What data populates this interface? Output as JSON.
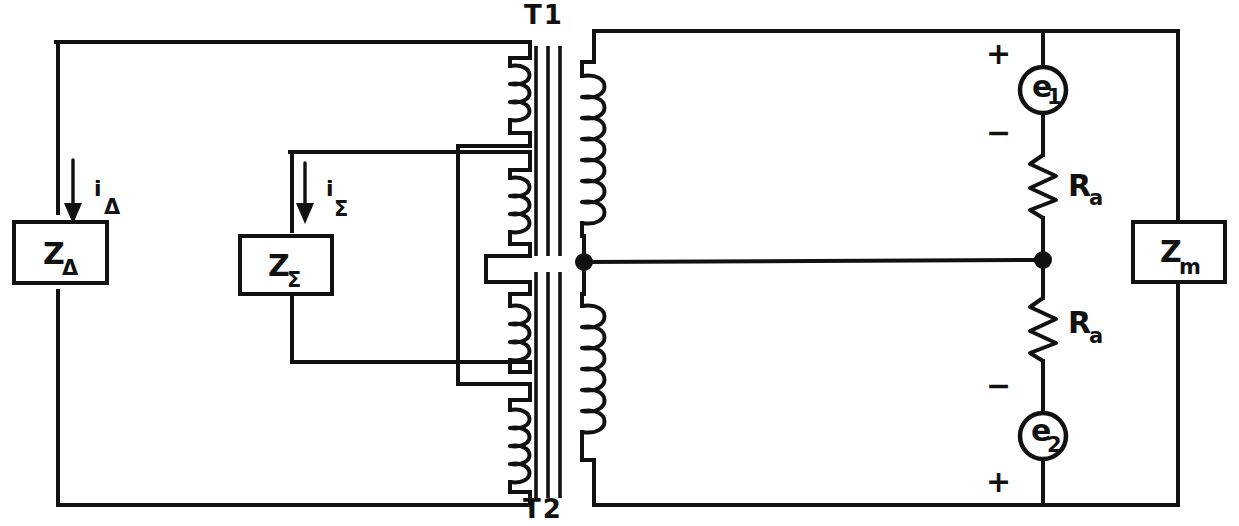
{
  "figure": {
    "kind": "circuit-schematic"
  },
  "labels": {
    "transformer_top": "T1",
    "transformer_bottom": "T2",
    "impedance_delta": {
      "symbol": "Z",
      "subscript": "Δ"
    },
    "impedance_sigma": {
      "symbol": "Z",
      "subscript": "Σ"
    },
    "impedance_m": {
      "symbol": "Z",
      "subscript": "m"
    },
    "current_delta": {
      "symbol": "i",
      "subscript": "Δ"
    },
    "current_sigma": {
      "symbol": "i",
      "subscript": "Σ"
    },
    "source_1": {
      "symbol": "e",
      "subscript": "1"
    },
    "source_2": {
      "symbol": "e",
      "subscript": "2"
    },
    "resistor_top": {
      "symbol": "R",
      "subscript": "a"
    },
    "resistor_bottom": {
      "symbol": "R",
      "subscript": "a"
    },
    "polarity_plus_top": "+",
    "polarity_minus_top": "−",
    "polarity_minus_bottom": "−",
    "polarity_plus_bottom": "+"
  },
  "colors": {
    "line": "#111111",
    "background": "#ffffff"
  },
  "components": [
    {
      "name": "Z-delta-box",
      "type": "impedance",
      "label": "ZΔ"
    },
    {
      "name": "Z-sigma-box",
      "type": "impedance",
      "label": "ZΣ"
    },
    {
      "name": "Z-m-box",
      "type": "impedance",
      "label": "Zm"
    },
    {
      "name": "transformer-T1",
      "type": "transformer",
      "label": "T1",
      "primary_windings": 2,
      "secondary_windings": 1
    },
    {
      "name": "transformer-T2",
      "type": "transformer",
      "label": "T2",
      "primary_windings": 2,
      "secondary_windings": 1
    },
    {
      "name": "source-e1",
      "type": "voltage-source",
      "label": "e1"
    },
    {
      "name": "source-e2",
      "type": "voltage-source",
      "label": "e2"
    },
    {
      "name": "resistor-Ra-top",
      "type": "resistor",
      "label": "Ra"
    },
    {
      "name": "resistor-Ra-bottom",
      "type": "resistor",
      "label": "Ra"
    }
  ]
}
